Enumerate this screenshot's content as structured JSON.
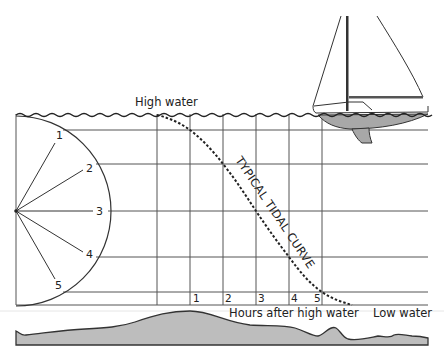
{
  "diagram": {
    "labels": {
      "high_water": "High water",
      "low_water": "Low water",
      "hours_axis": "Hours after high water",
      "curve": "TYPICAL TIDAL CURVE"
    },
    "hour_ticks": [
      "1",
      "2",
      "3",
      "4",
      "5"
    ],
    "semicircle_marks": [
      "1",
      "2",
      "3",
      "4",
      "5"
    ],
    "colors": {
      "line": "#333333",
      "seabed_fill": "#bdbdbd",
      "hull_fill": "#a8a8a8",
      "grid": "#555555"
    }
  }
}
